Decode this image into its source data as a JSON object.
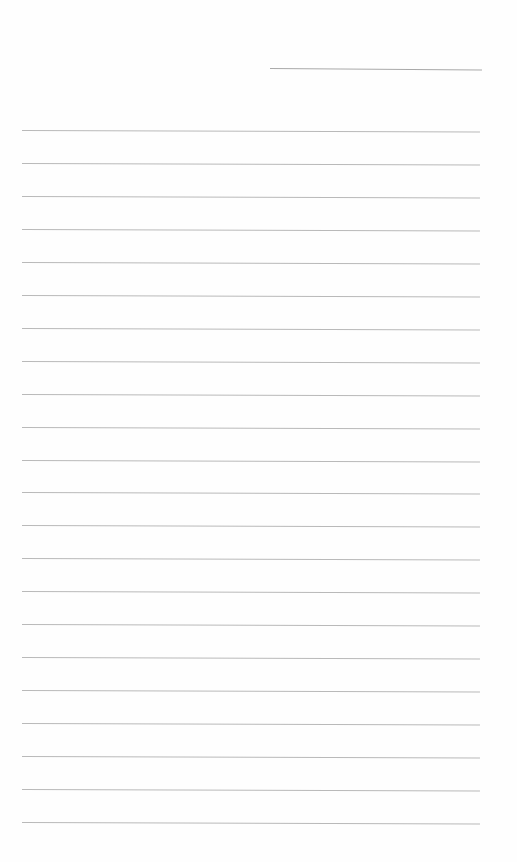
{
  "document": {
    "type": "blank ruled sheet",
    "header_line": {
      "x": 270,
      "y": 68,
      "width": 212
    },
    "ruled_lines": {
      "count": 22,
      "x": 22,
      "width": 458,
      "first_y": 130,
      "spacing": 32.95
    },
    "line_color": "#b9b9b9",
    "background_color": "#ffffff",
    "text": []
  }
}
